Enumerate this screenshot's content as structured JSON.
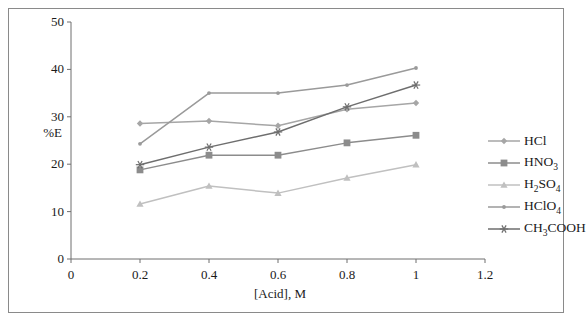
{
  "chart_data": {
    "type": "line",
    "title": "",
    "xlabel": "[Acid], M",
    "ylabel": "%E",
    "xlim": [
      0,
      1.2
    ],
    "ylim": [
      0,
      50
    ],
    "xticks": [
      "0",
      "0.2",
      "0.4",
      "0.6",
      "0.8",
      "1",
      "1.2"
    ],
    "yticks": [
      "0",
      "10",
      "20",
      "30",
      "40",
      "50"
    ],
    "xtick_values": [
      0,
      0.2,
      0.4,
      0.6,
      0.8,
      1,
      1.2
    ],
    "ytick_values": [
      0,
      10,
      20,
      30,
      40,
      50
    ],
    "grid": false,
    "legend_position": "right",
    "x": [
      0.2,
      0.4,
      0.6,
      0.8,
      1.0
    ],
    "series": [
      {
        "name": "HCl",
        "marker": "diamond",
        "color": "#a6a6a6",
        "values": [
          28.6,
          29.1,
          28.1,
          31.6,
          32.9
        ]
      },
      {
        "name": "HNO3",
        "label_html": "HNO<sub>3</sub>",
        "marker": "square",
        "color": "#8c8c8c",
        "values": [
          18.8,
          21.9,
          21.9,
          24.5,
          26.1
        ]
      },
      {
        "name": "H2SO4",
        "label_html": "H<sub>2</sub>SO<sub>4</sub>",
        "marker": "triangle",
        "color": "#c0c0c0",
        "values": [
          11.6,
          15.4,
          13.9,
          17.1,
          19.9
        ]
      },
      {
        "name": "HClO4",
        "label_html": "HClO<sub>4</sub>",
        "marker": "dot",
        "color": "#9a9a9a",
        "values": [
          24.3,
          35.0,
          35.0,
          36.7,
          40.3
        ]
      },
      {
        "name": "CH3COOH",
        "label_html": "CH<sub>3</sub>COOH",
        "marker": "asterisk",
        "color": "#6e6e6e",
        "values": [
          19.9,
          23.6,
          26.8,
          32.1,
          36.7
        ]
      }
    ]
  },
  "legend": {
    "items": [
      {
        "label": "HCl"
      },
      {
        "label": "HNO3"
      },
      {
        "label": "H2SO4"
      },
      {
        "label": "HClO4"
      },
      {
        "label": "CH3COOH"
      }
    ]
  }
}
